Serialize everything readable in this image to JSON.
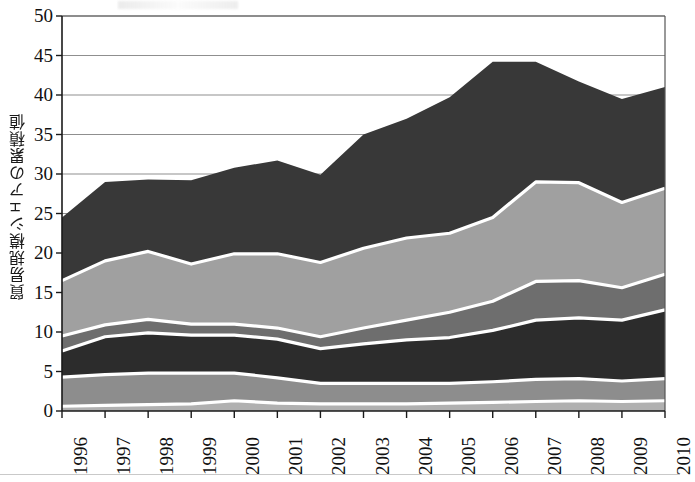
{
  "chart_data": {
    "type": "area",
    "title": "",
    "xlabel": "",
    "ylabel": "貿易規模シェアの累積値",
    "ylim": [
      0,
      50
    ],
    "ytick_labels": [
      "0",
      "5",
      "10",
      "15",
      "20",
      "25",
      "30",
      "35",
      "40",
      "45",
      "50"
    ],
    "yticks": [
      0,
      5,
      10,
      15,
      20,
      25,
      30,
      35,
      40,
      45,
      50
    ],
    "grid": true,
    "legend": "none",
    "stacked": true,
    "categories": [
      "1996",
      "1997",
      "1998",
      "1999",
      "2000",
      "2001",
      "2002",
      "2003",
      "2004",
      "2005",
      "2006",
      "2007",
      "2008",
      "2009",
      "2010"
    ],
    "x": [
      1996,
      1997,
      1998,
      1999,
      2000,
      2001,
      2002,
      2003,
      2004,
      2005,
      2006,
      2007,
      2008,
      2009,
      2010
    ],
    "series": [
      {
        "name": "layer-1",
        "color": "#b0b0b0",
        "values": [
          0.6,
          0.7,
          0.8,
          0.9,
          1.3,
          1.0,
          0.9,
          0.9,
          0.9,
          1.0,
          1.1,
          1.2,
          1.3,
          1.2,
          1.3
        ]
      },
      {
        "name": "layer-2",
        "color": "#8d8d8d",
        "values": [
          3.7,
          3.9,
          4.0,
          3.9,
          3.5,
          3.2,
          2.6,
          2.6,
          2.6,
          2.5,
          2.6,
          2.8,
          2.8,
          2.6,
          2.8
        ]
      },
      {
        "name": "layer-3",
        "color": "#2c2c2c",
        "values": [
          3.3,
          4.8,
          5.1,
          4.8,
          4.8,
          4.9,
          4.4,
          5.0,
          5.5,
          5.8,
          6.5,
          7.5,
          7.7,
          7.7,
          8.7
        ]
      },
      {
        "name": "layer-4",
        "color": "#6e6e6e",
        "values": [
          1.9,
          1.5,
          1.7,
          1.4,
          1.4,
          1.4,
          1.5,
          2.0,
          2.5,
          3.2,
          3.7,
          4.9,
          4.7,
          4.1,
          4.5
        ]
      },
      {
        "name": "layer-5",
        "color": "#a0a0a0",
        "values": [
          7.0,
          8.1,
          8.6,
          7.6,
          8.9,
          9.4,
          9.4,
          10.1,
          10.4,
          10.0,
          10.6,
          12.6,
          12.4,
          10.8,
          10.9
        ]
      },
      {
        "name": "layer-6",
        "color": "#383838",
        "values": [
          8.0,
          10.0,
          9.1,
          10.6,
          10.9,
          11.8,
          11.1,
          14.4,
          15.1,
          17.2,
          19.7,
          15.2,
          12.8,
          13.1,
          12.8
        ]
      }
    ],
    "cumulative_totals": [
      24.5,
      29.0,
      29.3,
      29.2,
      30.8,
      31.7,
      29.9,
      35.0,
      37.0,
      39.7,
      44.2,
      44.2,
      41.7,
      39.5,
      41.0
    ],
    "annotations": []
  },
  "axes": {
    "y_axis_label": "貿易規模シェアの累積値",
    "y_min": 0,
    "y_max": 50,
    "y_step": 5
  }
}
